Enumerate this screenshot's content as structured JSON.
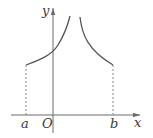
{
  "figure": {
    "colors": {
      "axis": "#6a6a6a",
      "curve": "#555555",
      "dashed": "#8a8a8a",
      "label": "#3a3a3a"
    },
    "labels": {
      "x_axis": "x",
      "y_axis": "y",
      "origin": "O",
      "a": "a",
      "b": "b"
    }
  }
}
